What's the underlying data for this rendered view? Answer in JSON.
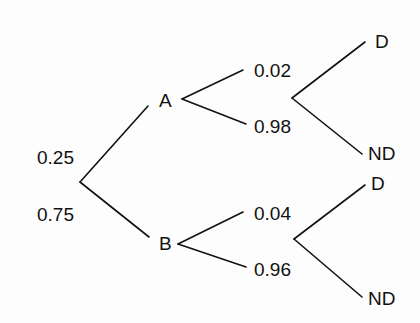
{
  "diagram": {
    "type": "probability tree",
    "root": {
      "branches": [
        {
          "label": "0.25",
          "node": "A"
        },
        {
          "label": "0.75",
          "node": "B"
        }
      ]
    },
    "A": {
      "label": "A",
      "branches": [
        {
          "label": "0.02"
        },
        {
          "label": "0.98"
        }
      ],
      "outcomes": [
        "D",
        "ND"
      ]
    },
    "B": {
      "label": "B",
      "branches": [
        {
          "label": "0.04"
        },
        {
          "label": "0.96"
        }
      ],
      "outcomes": [
        "D",
        "ND"
      ]
    },
    "line_color": "#111111"
  }
}
